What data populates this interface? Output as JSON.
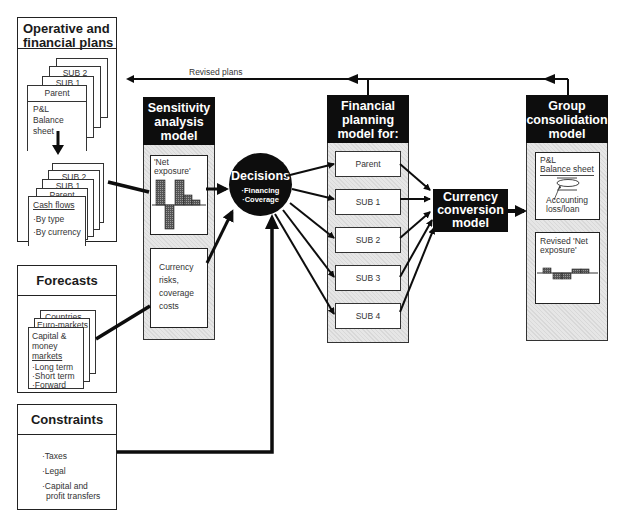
{
  "panels": {
    "plans": {
      "title": "Operative and financial plans",
      "title_line1": "Operative and",
      "title_line2": "financial plans",
      "stack1": {
        "pages": [
          "SUB 2",
          "SUB 1",
          "Parent"
        ],
        "body_line1": "P&L",
        "body_line2": "Balance sheet"
      },
      "stack2": {
        "pages": [
          "SUB 2",
          "SUB 1",
          "Parent"
        ],
        "heading": "Cash flows",
        "items": [
          "·By type",
          "·By currency"
        ]
      }
    },
    "forecasts": {
      "title": "Forecasts",
      "pages": [
        "Countries...",
        "Euro-markets"
      ],
      "front_line1": "Capital &",
      "front_line2": "money",
      "front_line3": "markets",
      "items": [
        "·Long term",
        "·Short term",
        "·Forward"
      ]
    },
    "constraints": {
      "title": "Constraints",
      "items": [
        "·Taxes",
        "·Legal",
        "·Capital and",
        "profit transfers"
      ]
    }
  },
  "models": {
    "sensitivity": {
      "title_line1": "Sensitivity",
      "title_line2": "analysis",
      "title_line3": "model",
      "net_exposure_line1": "'Net",
      "net_exposure_line2": "exposure'",
      "risks_line1": "Currency",
      "risks_line2": "risks,",
      "risks_line3": "coverage",
      "risks_line4": "costs"
    },
    "decisions": {
      "title": "Decisions",
      "items": [
        "·Financing",
        "·Coverage"
      ]
    },
    "financial_planning": {
      "title_line1": "Financial",
      "title_line2": "planning",
      "title_line3": "model for:",
      "entities": [
        "Parent",
        "SUB 1",
        "SUB 2",
        "SUB 3",
        "SUB 4"
      ]
    },
    "currency_conversion": {
      "title_line1": "Currency",
      "title_line2": "conversion",
      "title_line3": "model"
    },
    "group_consolidation": {
      "title_line1": "Group",
      "title_line2": "consolidation",
      "title_line3": "model",
      "pl_line1": "P&L",
      "pl_line2": "Balance sheet",
      "accounting_line1": "Accounting",
      "accounting_line2": "loss/loan",
      "revised_line1": "Revised 'Net",
      "revised_line2": "exposure'"
    }
  },
  "connectors": {
    "revised_plans_label": "Revised plans"
  },
  "colors": {
    "ink": "#0d0d0d",
    "hatch_fill": "#e6e6e6",
    "bar_fill": "#6e6e6e",
    "paper": "#ffffff"
  }
}
